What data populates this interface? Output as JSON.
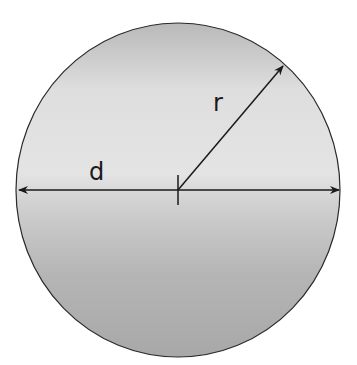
{
  "diagram": {
    "type": "circle-geometry",
    "labels": {
      "radius": "r",
      "diameter": "d"
    },
    "circle": {
      "cx": 178,
      "cy": 190,
      "rx": 162,
      "ry": 167
    },
    "colors": {
      "fill_light": "#e6e6e6",
      "fill_dark": "#a9a9a9",
      "stroke": "#2a2a2a",
      "background": "#ffffff"
    }
  }
}
